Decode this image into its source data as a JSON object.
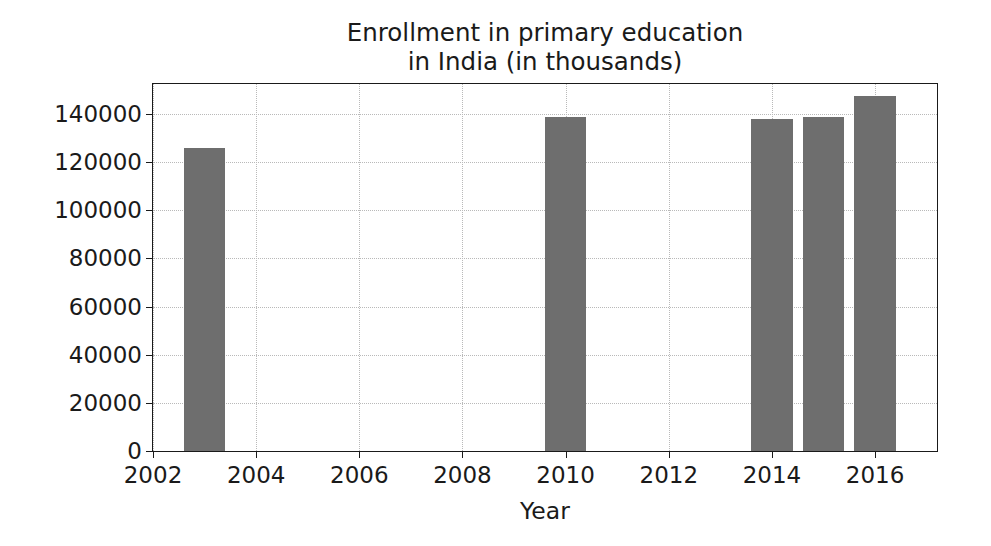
{
  "chart_data": {
    "type": "bar",
    "title": "Enrollment in primary education\nin India (in thousands)",
    "title_line1": "Enrollment in primary education",
    "title_line2": "in India (in thousands)",
    "xlabel": "Year",
    "ylabel": "",
    "categories": [
      2003,
      2010,
      2014,
      2015,
      2016
    ],
    "values": [
      125800,
      139000,
      137900,
      139000,
      147500
    ],
    "series": [
      {
        "name": "Enrollment in primary education in India (in thousands)",
        "values": [
          125800,
          139000,
          137900,
          139000,
          147500
        ]
      }
    ],
    "xlim": [
      2002,
      2017.2
    ],
    "ylim": [
      0,
      152500
    ],
    "xticks": [
      2002,
      2004,
      2006,
      2008,
      2010,
      2012,
      2014,
      2016
    ],
    "xtick_labels": [
      "2002",
      "2004",
      "2006",
      "2008",
      "2010",
      "2012",
      "2014",
      "2016"
    ],
    "yticks": [
      0,
      20000,
      40000,
      60000,
      80000,
      100000,
      120000,
      140000
    ],
    "ytick_labels": [
      "0",
      "20000",
      "40000",
      "60000",
      "80000",
      "100000",
      "120000",
      "140000"
    ],
    "grid": true,
    "grid_axis": "both",
    "legend": false,
    "bar_width": 0.8,
    "bar_color": "#6e6e6e",
    "grid_color": "#b9b9b9",
    "axis_color": "#1a1a1a",
    "background_color": "#ffffff"
  }
}
